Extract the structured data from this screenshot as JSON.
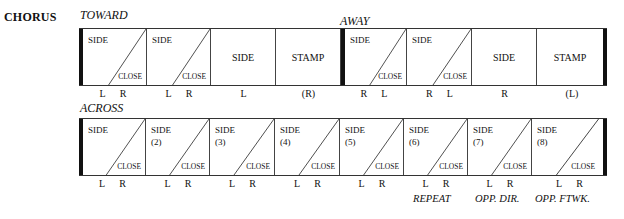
{
  "section": "CHORUS",
  "rows": [
    {
      "groups": [
        {
          "label": "TOWARD"
        },
        {
          "label": "AWAY"
        }
      ],
      "cells": [
        {
          "type": "split",
          "top": "SIDE",
          "bottom": "CLOSE",
          "feet": [
            "L",
            "R"
          ]
        },
        {
          "type": "split",
          "top": "SIDE",
          "bottom": "CLOSE",
          "feet": [
            "L",
            "R"
          ]
        },
        {
          "type": "single",
          "label": "SIDE",
          "feet": [
            "L"
          ]
        },
        {
          "type": "single",
          "label": "STAMP",
          "feet": [
            "(R)"
          ]
        },
        {
          "type": "split",
          "top": "SIDE",
          "bottom": "CLOSE",
          "feet": [
            "R",
            "L"
          ]
        },
        {
          "type": "split",
          "top": "SIDE",
          "bottom": "CLOSE",
          "feet": [
            "R",
            "L"
          ]
        },
        {
          "type": "single",
          "label": "SIDE",
          "feet": [
            "R"
          ]
        },
        {
          "type": "single",
          "label": "STAMP",
          "feet": [
            "(L)"
          ]
        }
      ]
    },
    {
      "groups": [
        {
          "label": "ACROSS"
        }
      ],
      "cells": [
        {
          "type": "split",
          "top": "SIDE",
          "num": "",
          "bottom": "CLOSE",
          "feet": [
            "L",
            "R"
          ]
        },
        {
          "type": "split",
          "top": "SIDE",
          "num": "(2)",
          "bottom": "CLOSE",
          "feet": [
            "L",
            "R"
          ]
        },
        {
          "type": "split",
          "top": "SIDE",
          "num": "(3)",
          "bottom": "CLOSE",
          "feet": [
            "L",
            "R"
          ]
        },
        {
          "type": "split",
          "top": "SIDE",
          "num": "(4)",
          "bottom": "CLOSE",
          "feet": [
            "L",
            "R"
          ]
        },
        {
          "type": "split",
          "top": "SIDE",
          "num": "(5)",
          "bottom": "CLOSE",
          "feet": [
            "L",
            "R"
          ]
        },
        {
          "type": "split",
          "top": "SIDE",
          "num": "(6)",
          "bottom": "CLOSE",
          "feet": [
            "L",
            "R"
          ]
        },
        {
          "type": "split",
          "top": "SIDE",
          "num": "(7)",
          "bottom": "CLOSE",
          "feet": [
            "L",
            "R"
          ]
        },
        {
          "type": "split",
          "top": "SIDE",
          "num": "(8)",
          "bottom": "CLOSE",
          "feet": [
            "L",
            "R"
          ]
        }
      ],
      "notes": [
        "REPEAT",
        "OPP. DIR.",
        "OPP. FTWK."
      ]
    }
  ]
}
